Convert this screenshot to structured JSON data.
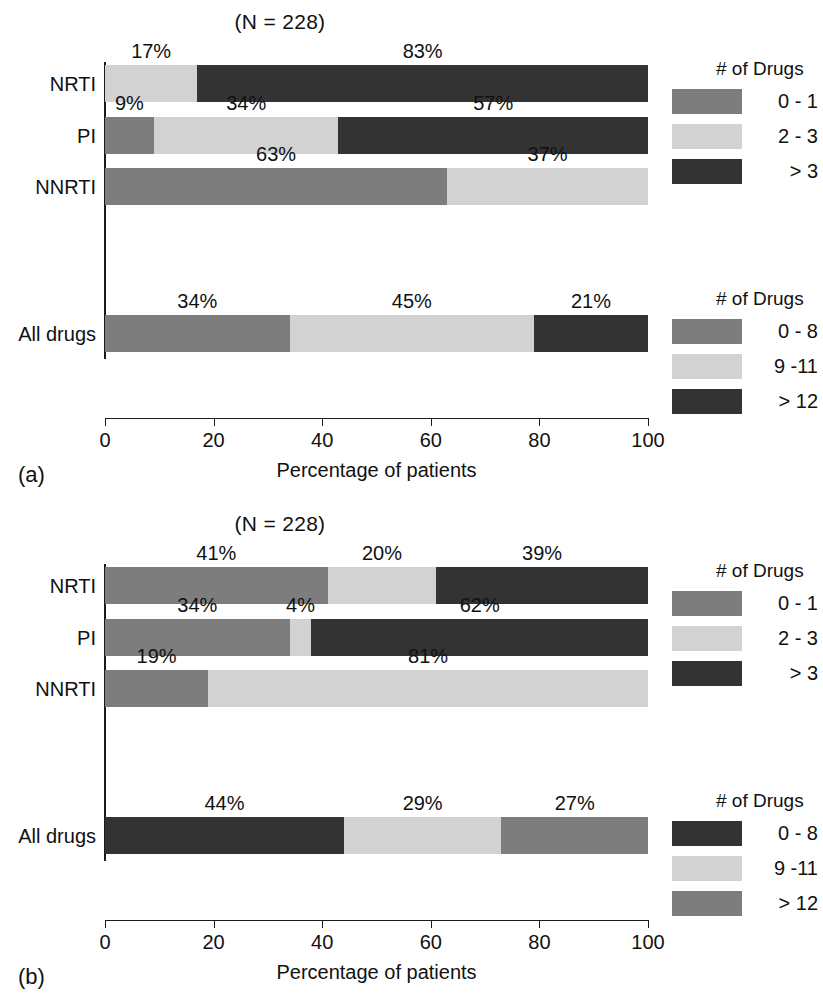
{
  "figure": {
    "xlabel": "Percentage of patients",
    "title": "(N = 228)",
    "axis_ticks": [
      "0",
      "20",
      "40",
      "60",
      "80",
      "100"
    ],
    "categories": [
      "NRTI",
      "PI",
      "NNRTI",
      "All drugs"
    ],
    "panel_a_tag": "(a)",
    "panel_b_tag": "(b)"
  },
  "colors": {
    "medium_gray": "#7d7d7d",
    "light_gray": "#d2d2d2",
    "dark_gray": "#333333",
    "axis": "#1a1a1a",
    "background": "#ffffff"
  },
  "panel_a": {
    "tag": "(a)",
    "title": "(N = 228)",
    "xlabel": "Percentage of patients",
    "legend_top": {
      "title": "# of Drugs",
      "items": [
        {
          "label": "0 - 1",
          "color": "#7d7d7d"
        },
        {
          "label": "2 - 3",
          "color": "#d2d2d2"
        },
        {
          "label": "> 3",
          "color": "#333333"
        }
      ]
    },
    "legend_bottom": {
      "title": "# of Drugs",
      "items": [
        {
          "label": "0 - 8",
          "color": "#7d7d7d"
        },
        {
          "label": "9 -11",
          "color": "#d2d2d2"
        },
        {
          "label": "> 12",
          "color": "#333333"
        }
      ]
    },
    "bars": [
      {
        "category": "NRTI",
        "segments": [
          {
            "value": 0,
            "label": "",
            "color": "#7d7d7d"
          },
          {
            "value": 17,
            "label": "17%",
            "color": "#d2d2d2"
          },
          {
            "value": 83,
            "label": "83%",
            "color": "#333333"
          }
        ]
      },
      {
        "category": "PI",
        "segments": [
          {
            "value": 9,
            "label": "9%",
            "color": "#7d7d7d"
          },
          {
            "value": 34,
            "label": "34%",
            "color": "#d2d2d2"
          },
          {
            "value": 57,
            "label": "57%",
            "color": "#333333"
          }
        ]
      },
      {
        "category": "NNRTI",
        "segments": [
          {
            "value": 63,
            "label": "63%",
            "color": "#7d7d7d"
          },
          {
            "value": 37,
            "label": "37%",
            "color": "#d2d2d2"
          },
          {
            "value": 0,
            "label": "",
            "color": "#333333"
          }
        ]
      },
      {
        "category": "All drugs",
        "segments": [
          {
            "value": 34,
            "label": "34%",
            "color": "#7d7d7d"
          },
          {
            "value": 45,
            "label": "45%",
            "color": "#d2d2d2"
          },
          {
            "value": 21,
            "label": "21%",
            "color": "#333333"
          }
        ]
      }
    ]
  },
  "panel_b": {
    "tag": "(b)",
    "title": "(N = 228)",
    "xlabel": "Percentage of patients",
    "legend_top": {
      "title": "# of Drugs",
      "items": [
        {
          "label": "0 - 1",
          "color": "#7d7d7d"
        },
        {
          "label": "2 - 3",
          "color": "#d2d2d2"
        },
        {
          "label": "> 3",
          "color": "#333333"
        }
      ]
    },
    "legend_bottom": {
      "title": "# of Drugs",
      "items": [
        {
          "label": "0 - 8",
          "color": "#333333"
        },
        {
          "label": "9 -11",
          "color": "#d2d2d2"
        },
        {
          "label": "> 12",
          "color": "#7d7d7d"
        }
      ]
    },
    "bars": [
      {
        "category": "NRTI",
        "segments": [
          {
            "value": 41,
            "label": "41%",
            "color": "#7d7d7d"
          },
          {
            "value": 20,
            "label": "20%",
            "color": "#d2d2d2"
          },
          {
            "value": 39,
            "label": "39%",
            "color": "#333333"
          }
        ]
      },
      {
        "category": "PI",
        "segments": [
          {
            "value": 34,
            "label": "34%",
            "color": "#7d7d7d"
          },
          {
            "value": 4,
            "label": "4%",
            "color": "#d2d2d2"
          },
          {
            "value": 62,
            "label": "62%",
            "color": "#333333"
          }
        ]
      },
      {
        "category": "NNRTI",
        "segments": [
          {
            "value": 19,
            "label": "19%",
            "color": "#7d7d7d"
          },
          {
            "value": 81,
            "label": "81%",
            "color": "#d2d2d2"
          },
          {
            "value": 0,
            "label": "",
            "color": "#333333"
          }
        ]
      },
      {
        "category": "All drugs",
        "segments": [
          {
            "value": 44,
            "label": "44%",
            "color": "#333333"
          },
          {
            "value": 29,
            "label": "29%",
            "color": "#d2d2d2"
          },
          {
            "value": 27,
            "label": "27%",
            "color": "#7d7d7d"
          }
        ]
      }
    ]
  },
  "chart_data": {
    "type": "bar",
    "orientation": "horizontal",
    "stacked": true,
    "title": "(N = 228)",
    "xlabel": "Percentage of patients",
    "ylabel": "",
    "xlim": [
      0,
      100
    ],
    "xticks": [
      0,
      20,
      40,
      60,
      80,
      100
    ],
    "grid": false,
    "legend_position": "right",
    "panels": [
      {
        "panel": "(a)",
        "title": "(N = 228)",
        "categories": [
          "NRTI",
          "PI",
          "NNRTI",
          "All drugs"
        ],
        "series": [
          {
            "name": "0 - 1",
            "values": [
              0,
              9,
              63,
              null
            ]
          },
          {
            "name": "2 - 3",
            "values": [
              17,
              34,
              37,
              null
            ]
          },
          {
            "name": "> 3",
            "values": [
              83,
              57,
              0,
              null
            ]
          },
          {
            "name": "0 - 8",
            "values": [
              null,
              null,
              null,
              34
            ]
          },
          {
            "name": "9 -11",
            "values": [
              null,
              null,
              null,
              45
            ]
          },
          {
            "name": "> 12",
            "values": [
              null,
              null,
              null,
              21
            ]
          }
        ],
        "legends": [
          {
            "title": "# of Drugs",
            "entries": [
              "0 - 1",
              "2 - 3",
              "> 3"
            ]
          },
          {
            "title": "# of Drugs",
            "entries": [
              "0 - 8",
              "9 -11",
              "> 12"
            ]
          }
        ]
      },
      {
        "panel": "(b)",
        "title": "(N = 228)",
        "categories": [
          "NRTI",
          "PI",
          "NNRTI",
          "All drugs"
        ],
        "series": [
          {
            "name": "0 - 1",
            "values": [
              41,
              34,
              19,
              null
            ]
          },
          {
            "name": "2 - 3",
            "values": [
              20,
              4,
              81,
              null
            ]
          },
          {
            "name": "> 3",
            "values": [
              39,
              62,
              0,
              null
            ]
          },
          {
            "name": "0 - 8",
            "values": [
              null,
              null,
              null,
              44
            ]
          },
          {
            "name": "9 -11",
            "values": [
              null,
              null,
              null,
              29
            ]
          },
          {
            "name": "> 12",
            "values": [
              null,
              null,
              null,
              27
            ]
          }
        ],
        "legends": [
          {
            "title": "# of Drugs",
            "entries": [
              "0 - 1",
              "2 - 3",
              "> 3"
            ]
          },
          {
            "title": "# of Drugs",
            "entries": [
              "0 - 8",
              "9 -11",
              "> 12"
            ]
          }
        ]
      }
    ]
  }
}
